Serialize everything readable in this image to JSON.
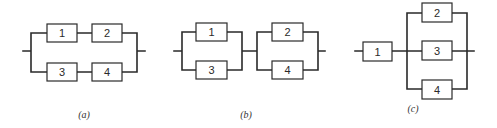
{
  "figure": {
    "diagrams": [
      {
        "id": "a",
        "caption": "(a)",
        "structure": "parallel of two series branches: (1-2) || (3-4)",
        "blocks": [
          "1",
          "2",
          "3",
          "4"
        ]
      },
      {
        "id": "b",
        "caption": "(b)",
        "structure": "series of two parallel groups: (1 || 3) - (2 || 4)",
        "blocks": [
          "1",
          "3",
          "2",
          "4"
        ]
      },
      {
        "id": "c",
        "caption": "(c)",
        "structure": "block 1 in series with parallel group (2 || 3 || 4)",
        "blocks": [
          "1",
          "2",
          "3",
          "4"
        ]
      }
    ]
  },
  "colors": {
    "line": "#2a2a2a",
    "background": "#ffffff"
  }
}
